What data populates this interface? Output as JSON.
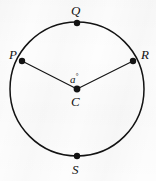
{
  "figure": {
    "kind": "circle-geometry-diagram",
    "background_color": "#fdfdfd",
    "stroke_color": "#131313",
    "circle": {
      "center_label": "C",
      "center_x": 77,
      "center_y": 89,
      "radius": 67,
      "stroke_width": 1.5
    },
    "points": [
      {
        "id": "Q",
        "label": "Q",
        "x": 77,
        "y": 23,
        "on_circle": true,
        "position": "top"
      },
      {
        "id": "P",
        "label": "P",
        "x": 22,
        "y": 61,
        "on_circle": true,
        "position": "upper-left"
      },
      {
        "id": "R",
        "label": "R",
        "x": 133,
        "y": 61,
        "on_circle": true,
        "position": "upper-right"
      },
      {
        "id": "S",
        "label": "S",
        "x": 77,
        "y": 156,
        "on_circle": true,
        "position": "bottom"
      },
      {
        "id": "C",
        "label": "C",
        "x": 77,
        "y": 89,
        "on_circle": false,
        "position": "center"
      }
    ],
    "segments": [
      {
        "id": "radius-CP",
        "from": "C",
        "to": "P"
      },
      {
        "id": "radius-CR",
        "from": "C",
        "to": "R"
      }
    ],
    "angle": {
      "id": "angle-PCR",
      "vertex": "C",
      "rays": [
        "P",
        "R"
      ],
      "label": "a",
      "unit_symbol": "°"
    },
    "dot_radius": 3.2
  }
}
